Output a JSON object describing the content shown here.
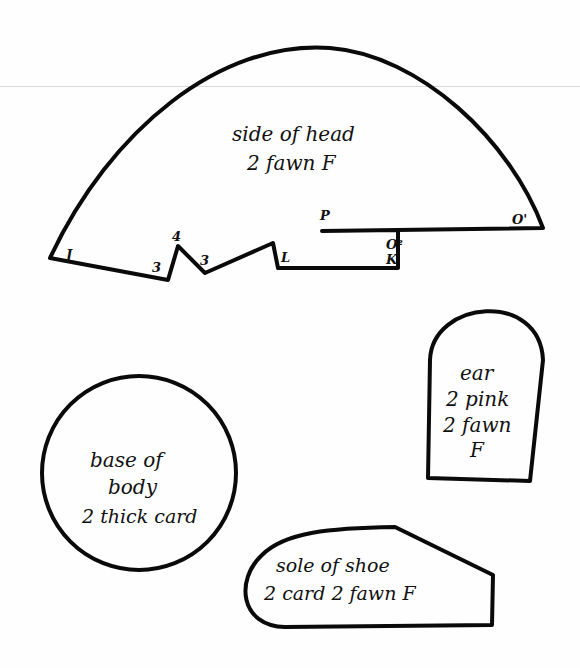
{
  "pieces": {
    "side_of_head": {
      "title": "side of head",
      "instruction": "2 fawn F",
      "marks": {
        "j": "J",
        "three_a": "3",
        "four": "4",
        "three_b": "3",
        "l": "L",
        "p": "P",
        "o1": "O'",
        "o2": "O²",
        "k": "K"
      }
    },
    "ear": {
      "title": "ear",
      "line2": "2 pink",
      "line3": "2 fawn",
      "line4": "F"
    },
    "base_of_body": {
      "line1": "base of",
      "line2": "body",
      "line3": "2 thick card"
    },
    "sole_of_shoe": {
      "title": "sole of shoe",
      "instruction": "2 card 2 fawn F"
    }
  },
  "colors": {
    "ink": "#0a0a0a",
    "paper": "#fefefe",
    "rule": "#d8d8d8"
  }
}
